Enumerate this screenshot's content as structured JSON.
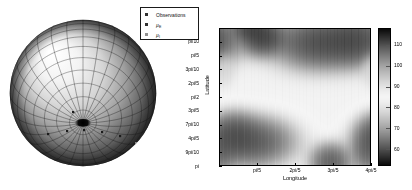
{
  "figure": {
    "background": "#ffffff",
    "panels": [
      "sphere-3d",
      "heatmap-2d"
    ]
  },
  "sphere_panel": {
    "name": "3D Sphere with Observations",
    "description": "Shaded grey sphere with latitude/longitude wireframe mesh and a dark polar cap at the north pole; small square observation markers scattered over the lower hemisphere.",
    "mesh_color": "#2b2b2b",
    "light_shade": "#f2f2f2",
    "dark_shade": "#1e1e1e",
    "markers": [
      {
        "x": 38,
        "y": 126,
        "kind": "Observations"
      },
      {
        "x": 57,
        "y": 123,
        "kind": "Observations"
      },
      {
        "x": 74,
        "y": 122,
        "kind": "Observations"
      },
      {
        "x": 92,
        "y": 124,
        "kind": "Observations"
      },
      {
        "x": 110,
        "y": 128,
        "kind": "mu_E"
      },
      {
        "x": 126,
        "y": 135,
        "kind": "mu_I"
      },
      {
        "x": 132,
        "y": 146,
        "kind": "mu_I"
      },
      {
        "x": 112,
        "y": 155,
        "kind": "Observations"
      },
      {
        "x": 63,
        "y": 104,
        "kind": "Observations"
      }
    ]
  },
  "legend": {
    "name": "plot-legend",
    "border_color": "#1a1a1a",
    "entries": [
      {
        "label": "Observations",
        "marker": "square",
        "color": "#303030"
      },
      {
        "label": "µE",
        "label_base": "µ",
        "label_sub": "E",
        "marker": "square",
        "color": "#303030"
      },
      {
        "label": "µI",
        "label_base": "µ",
        "label_sub": "I",
        "marker": "square",
        "color": "#808080"
      }
    ]
  },
  "chart_data": {
    "type": "heatmap",
    "title": "",
    "xlabel": "Longitude",
    "ylabel": "Latitude",
    "colormap": "gray",
    "xlim": [
      0,
      2.5132741228718345
    ],
    "ylim": [
      0,
      3.141592653589793
    ],
    "xticks": [
      0.6283185307179586,
      1.2566370614359172,
      1.8849555921538759,
      2.5132741228718345
    ],
    "xticklabels": [
      "pi/5",
      "2pi/5",
      "3pi/5",
      "4pi/5"
    ],
    "yticks": [
      0.3141592653589793,
      0.6283185307179586,
      0.9424777960769379,
      1.2566370614359172,
      1.5707963267948966,
      1.8849555921538759,
      2.199114857512855,
      2.5132741228718345,
      2.827433388230814,
      3.141592653589793
    ],
    "yticklabels": [
      "pi/10",
      "pi/5",
      "3pi/10",
      "2pi/5",
      "pi/2",
      "3pi/5",
      "7pi/10",
      "4pi/5",
      "9pi/10",
      "pi"
    ],
    "grid": false,
    "colorbar": {
      "ticks": [
        60,
        70,
        80,
        90,
        100,
        110
      ],
      "ticklabels": [
        "60",
        "70",
        "80",
        "90",
        "100",
        "110"
      ],
      "vmin": 52,
      "vmax": 118,
      "position": "right"
    },
    "field_description": "Smooth bipolar intensity field: a dark (high ~115) lobe in the upper-right quadrant, a dark V-shaped notch near longitude pi/5 at the top, a dark (low ~55) blob in the lower-left quadrant, and a dark V-shaped feature near longitude 3pi/5 at the bottom. Mid-field is uniformly light grey (~85).",
    "blobs": [
      {
        "cx": 0.28,
        "cy": 0.06,
        "rx": 0.13,
        "ry": 0.12,
        "value": 118,
        "note": "top V notch near pi/5"
      },
      {
        "cx": 0.2,
        "cy": 0.0,
        "rx": 0.1,
        "ry": 0.07,
        "value": 115
      },
      {
        "cx": 0.66,
        "cy": 0.1,
        "rx": 0.26,
        "ry": 0.17,
        "value": 117,
        "note": "upper-right dark lobe"
      },
      {
        "cx": 0.92,
        "cy": 0.08,
        "rx": 0.18,
        "ry": 0.16,
        "value": 116
      },
      {
        "cx": 0.22,
        "cy": 0.83,
        "rx": 0.24,
        "ry": 0.16,
        "value": 54,
        "note": "lower-left dark blob"
      },
      {
        "cx": 0.08,
        "cy": 0.78,
        "rx": 0.14,
        "ry": 0.14,
        "value": 55
      },
      {
        "cx": 0.74,
        "cy": 0.98,
        "rx": 0.12,
        "ry": 0.12,
        "value": 55,
        "note": "bottom V near 3pi/5"
      },
      {
        "cx": 0.99,
        "cy": 0.9,
        "rx": 0.09,
        "ry": 0.14,
        "value": 58
      },
      {
        "cx": 0.02,
        "cy": 0.3,
        "rx": 0.06,
        "ry": 0.1,
        "value": 92
      }
    ],
    "background_value": 86
  }
}
